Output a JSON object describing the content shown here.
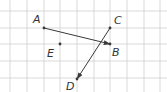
{
  "diagram": {
    "type": "vector-grid",
    "grid": {
      "x_lines": [
        10,
        27,
        44,
        60,
        77,
        94,
        110,
        127,
        144,
        160
      ],
      "y_lines": [
        11,
        28,
        44,
        61,
        78
      ],
      "color": "#cfcfcf"
    },
    "points": [
      {
        "id": "A",
        "label": "A",
        "x": 44,
        "y": 28,
        "lx": 33,
        "ly": 23
      },
      {
        "id": "B",
        "label": "B",
        "x": 110,
        "y": 44,
        "lx": 112,
        "ly": 56
      },
      {
        "id": "C",
        "label": "C",
        "x": 110,
        "y": 28,
        "lx": 114,
        "ly": 24
      },
      {
        "id": "D",
        "label": "D",
        "x": 77,
        "y": 79,
        "lx": 66,
        "ly": 90
      },
      {
        "id": "E",
        "label": "E",
        "x": 60,
        "y": 44,
        "lx": 47,
        "ly": 57
      }
    ],
    "vectors": [
      {
        "from": "A",
        "to": "B"
      },
      {
        "from": "C",
        "to": "D"
      }
    ],
    "ink_color": "#3a3a3a"
  }
}
